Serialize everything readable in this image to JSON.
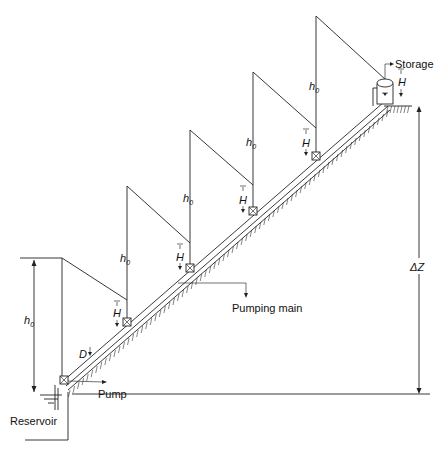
{
  "diagram": {
    "labels": {
      "storage": "Storage",
      "reservoir": "Reservoir",
      "pump": "Pump",
      "pumping_main": "Pumping main",
      "delta_z": "ΔZ",
      "diameter": "D",
      "head_h": "H",
      "h0_base": "h",
      "h0_sub": "0"
    },
    "stations": [
      {
        "name": "pump-station-0",
        "x": 64,
        "y": 380
      },
      {
        "name": "booster-station-1",
        "x": 127,
        "y": 322
      },
      {
        "name": "booster-station-2",
        "x": 190,
        "y": 268
      },
      {
        "name": "booster-station-3",
        "x": 253,
        "y": 211
      },
      {
        "name": "booster-station-4",
        "x": 316,
        "y": 156
      },
      {
        "name": "storage-tank",
        "x": 384,
        "y": 98
      }
    ],
    "colors": {
      "line": "#222222",
      "background": "#ffffff"
    }
  }
}
